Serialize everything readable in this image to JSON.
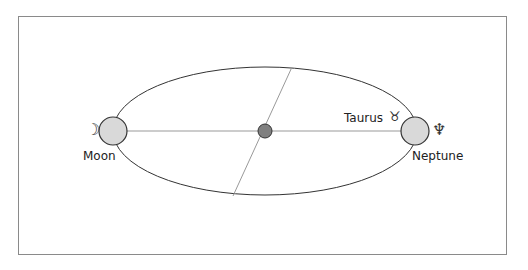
{
  "diagram": {
    "title": "",
    "frame_color": "#8a8a8a",
    "orbit": {
      "stroke": "#333333"
    },
    "center_body": {
      "fill": "#808080",
      "stroke": "#333333"
    },
    "planet_fill": "#d9d9d9",
    "bodies": [
      {
        "name": "Moon",
        "symbol": "☽",
        "position": "left"
      },
      {
        "name": "Neptune",
        "symbol": "♆",
        "position": "right"
      }
    ],
    "annotations": [
      {
        "text": "Taurus",
        "symbol": "♉"
      }
    ]
  }
}
